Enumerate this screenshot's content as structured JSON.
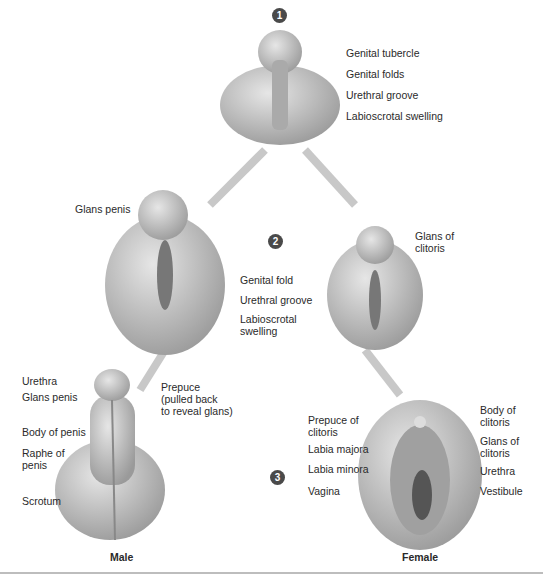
{
  "steps": [
    "1",
    "2",
    "3"
  ],
  "stage1": {
    "labels": [
      "Genital tubercle",
      "Genital folds",
      "Urethral groove",
      "Labioscrotal swelling"
    ]
  },
  "stage2": {
    "male_labels": [
      "Glans penis"
    ],
    "shared_labels": [
      "Genital fold",
      "Urethral groove",
      "Labioscrotal\nswelling"
    ],
    "female_labels": [
      "Glans of\nclitoris"
    ]
  },
  "stage3": {
    "male": {
      "caption": "Male",
      "labels": [
        "Urethra",
        "Glans penis",
        "Prepuce\n(pulled back\nto reveal glans)",
        "Body of penis",
        "Raphe of\npenis",
        "Scrotum"
      ]
    },
    "female": {
      "caption": "Female",
      "left_labels": [
        "Prepuce of\nclitoris",
        "Labia majora",
        "Labia minora",
        "Vagina"
      ],
      "right_labels": [
        "Body of\nclitoris",
        "Glans of\nclitoris",
        "Urethra",
        "Vestibule"
      ]
    }
  },
  "colors": {
    "tissue": "#c9c9c9",
    "tissue_dark": "#8a8a8a",
    "arrow": "#c8c8c8",
    "step_badge": "#4a4a4a"
  }
}
